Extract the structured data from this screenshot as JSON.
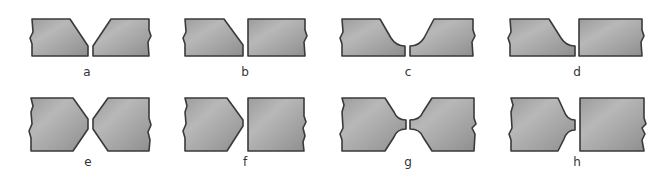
{
  "figure": {
    "colors": {
      "plate_fill_light": "#b4b4b4",
      "plate_fill_dark": "#8e8e8e",
      "outline": "#3a3a3a",
      "label": "#333333",
      "background": "#ffffff"
    },
    "panels": [
      {
        "id": "a",
        "label": "a",
        "type": "single-V (both plates beveled)"
      },
      {
        "id": "b",
        "label": "b",
        "type": "single bevel (one plate beveled)"
      },
      {
        "id": "c",
        "label": "c",
        "type": "single-U (both plates)"
      },
      {
        "id": "d",
        "label": "d",
        "type": "single-J (one plate)"
      },
      {
        "id": "e",
        "label": "e",
        "type": "double-V (both plates)"
      },
      {
        "id": "f",
        "label": "f",
        "type": "double bevel (one plate)"
      },
      {
        "id": "g",
        "label": "g",
        "type": "double-U (both plates)"
      },
      {
        "id": "h",
        "label": "h",
        "type": "double-J (one plate)"
      }
    ]
  }
}
